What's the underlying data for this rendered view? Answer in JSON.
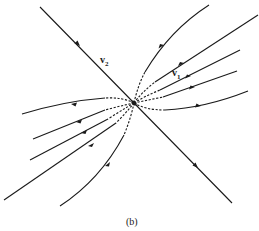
{
  "figure": {
    "caption": "(b)",
    "labels": {
      "v1": {
        "base": "v",
        "sub": "1"
      },
      "v2": {
        "base": "v",
        "sub": "2"
      }
    },
    "stroke_color": "#1a1a1a",
    "background": "#ffffff"
  }
}
